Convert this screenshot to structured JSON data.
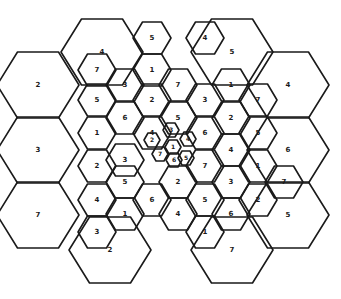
{
  "diagram": {
    "type": "hexagonal-reuse-pattern",
    "stroke_color": "#1a1a1a",
    "background": "#ffffff",
    "large_cells": [
      {
        "label": "4",
        "cx": 102,
        "cy": 52
      },
      {
        "label": "5",
        "cx": 232,
        "cy": 52
      },
      {
        "label": "2",
        "cx": 38,
        "cy": 85
      },
      {
        "label": "4",
        "cx": 288,
        "cy": 85
      },
      {
        "label": "3",
        "cx": 38,
        "cy": 150
      },
      {
        "label": "6",
        "cx": 288,
        "cy": 150
      },
      {
        "label": "7",
        "cx": 38,
        "cy": 215
      },
      {
        "label": "5",
        "cx": 288,
        "cy": 215
      },
      {
        "label": "2",
        "cx": 110,
        "cy": 250
      },
      {
        "label": "7",
        "cx": 232,
        "cy": 250
      }
    ],
    "medium_cells": [
      {
        "label": "5",
        "cx": 152,
        "cy": 38
      },
      {
        "label": "1",
        "cx": 152,
        "cy": 70
      },
      {
        "label": "4",
        "cx": 205,
        "cy": 38
      },
      {
        "label": "7",
        "cx": 178,
        "cy": 85
      },
      {
        "label": "1",
        "cx": 231,
        "cy": 85
      },
      {
        "label": "7",
        "cx": 97,
        "cy": 70
      },
      {
        "label": "3",
        "cx": 125,
        "cy": 85
      },
      {
        "label": "5",
        "cx": 97,
        "cy": 100
      },
      {
        "label": "2",
        "cx": 152,
        "cy": 100
      },
      {
        "label": "3",
        "cx": 205,
        "cy": 100
      },
      {
        "label": "7",
        "cx": 258,
        "cy": 100
      },
      {
        "label": "6",
        "cx": 125,
        "cy": 118
      },
      {
        "label": "5",
        "cx": 178,
        "cy": 118
      },
      {
        "label": "2",
        "cx": 231,
        "cy": 118
      },
      {
        "label": "1",
        "cx": 97,
        "cy": 133
      },
      {
        "label": "4",
        "cx": 152,
        "cy": 133
      },
      {
        "label": "6",
        "cx": 205,
        "cy": 133
      },
      {
        "label": "5",
        "cx": 258,
        "cy": 133
      },
      {
        "label": "3",
        "cx": 125,
        "cy": 160
      },
      {
        "label": "4",
        "cx": 231,
        "cy": 150
      },
      {
        "label": "2",
        "cx": 97,
        "cy": 166
      },
      {
        "label": "7",
        "cx": 205,
        "cy": 166
      },
      {
        "label": "1",
        "cx": 258,
        "cy": 166
      },
      {
        "label": "5",
        "cx": 125,
        "cy": 182
      },
      {
        "label": "2",
        "cx": 178,
        "cy": 182
      },
      {
        "label": "3",
        "cx": 231,
        "cy": 182
      },
      {
        "label": "7",
        "cx": 284,
        "cy": 182
      },
      {
        "label": "4",
        "cx": 97,
        "cy": 200
      },
      {
        "label": "6",
        "cx": 152,
        "cy": 200
      },
      {
        "label": "5",
        "cx": 205,
        "cy": 200
      },
      {
        "label": "2",
        "cx": 258,
        "cy": 200
      },
      {
        "label": "1",
        "cx": 125,
        "cy": 214
      },
      {
        "label": "4",
        "cx": 178,
        "cy": 214
      },
      {
        "label": "6",
        "cx": 231,
        "cy": 214
      },
      {
        "label": "3",
        "cx": 97,
        "cy": 232
      },
      {
        "label": "1",
        "cx": 205,
        "cy": 232
      }
    ],
    "small_cells": [
      {
        "label": "1",
        "cx": 173,
        "cy": 147
      },
      {
        "label": "7",
        "cx": 160,
        "cy": 154
      },
      {
        "label": "6",
        "cx": 174,
        "cy": 160
      },
      {
        "label": "2",
        "cx": 152,
        "cy": 140
      },
      {
        "label": "3",
        "cx": 171,
        "cy": 130
      },
      {
        "label": "4",
        "cx": 188,
        "cy": 139
      },
      {
        "label": "5",
        "cx": 186,
        "cy": 158
      }
    ]
  }
}
